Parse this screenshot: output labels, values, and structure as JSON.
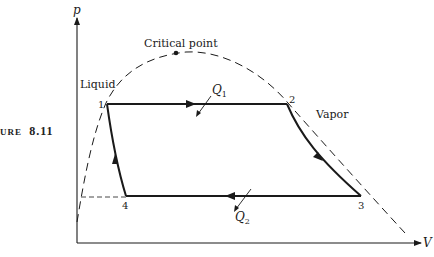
{
  "figure": {
    "label": "URE",
    "number": "8.11"
  },
  "axes": {
    "y_label": "p",
    "x_label": "V"
  },
  "regions": {
    "liquid": "Liquid",
    "vapor": "Vapor",
    "critical_point": "Critical point"
  },
  "states": [
    {
      "id": "1",
      "label": "1"
    },
    {
      "id": "2",
      "label": "2"
    },
    {
      "id": "3",
      "label": "3"
    },
    {
      "id": "4",
      "label": "4"
    }
  ],
  "heat": {
    "q1": "Q",
    "q1_sub": "1",
    "q2": "Q",
    "q2_sub": "2"
  },
  "colors": {
    "ink": "#1a1a1a",
    "background": "#ffffff"
  }
}
